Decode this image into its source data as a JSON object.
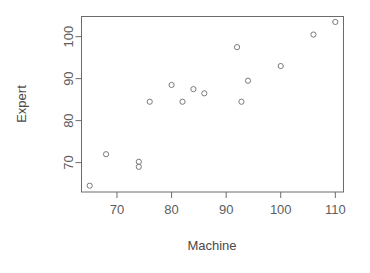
{
  "chart_data": {
    "type": "scatter",
    "title": "",
    "xlabel": "Machine",
    "ylabel": "Expert",
    "xlim": [
      63.5,
      111.5
    ],
    "ylim": [
      63.0,
      104.8
    ],
    "xticks": [
      70,
      80,
      90,
      100,
      110
    ],
    "yticks": [
      70,
      80,
      90,
      100
    ],
    "xtick_labels": [
      "70",
      "80",
      "90",
      "100",
      "110"
    ],
    "ytick_labels": [
      "70",
      "80",
      "90",
      "100"
    ],
    "grid": false,
    "legend": null,
    "marker": "open-circle",
    "marker_color": "#7a7a7a",
    "points": [
      {
        "x": 65.0,
        "y": 64.5
      },
      {
        "x": 68.0,
        "y": 72.0
      },
      {
        "x": 74.0,
        "y": 70.2
      },
      {
        "x": 74.0,
        "y": 69.0
      },
      {
        "x": 76.0,
        "y": 84.5
      },
      {
        "x": 80.0,
        "y": 88.5
      },
      {
        "x": 82.0,
        "y": 84.5
      },
      {
        "x": 84.0,
        "y": 87.5
      },
      {
        "x": 86.0,
        "y": 86.5
      },
      {
        "x": 92.0,
        "y": 97.5
      },
      {
        "x": 92.8,
        "y": 84.5
      },
      {
        "x": 94.0,
        "y": 89.5
      },
      {
        "x": 100.0,
        "y": 93.0
      },
      {
        "x": 106.0,
        "y": 100.5
      },
      {
        "x": 110.0,
        "y": 103.5
      }
    ],
    "x_values": [
      65.0,
      68.0,
      74.0,
      74.0,
      76.0,
      80.0,
      82.0,
      84.0,
      86.0,
      92.0,
      92.8,
      94.0,
      100.0,
      106.0,
      110.0
    ],
    "y_values": [
      64.5,
      72.0,
      70.2,
      69.0,
      84.5,
      88.5,
      84.5,
      87.5,
      86.5,
      97.5,
      84.5,
      89.5,
      93.0,
      100.5,
      103.5
    ]
  },
  "axes": {
    "x_axis_title": "Machine",
    "y_axis_title": "Expert"
  }
}
